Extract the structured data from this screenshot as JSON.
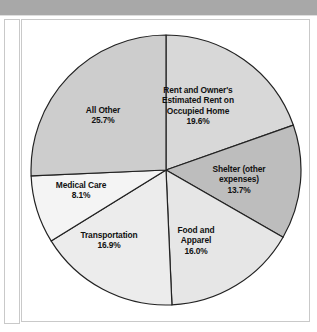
{
  "header": {
    "band_text": "",
    "band_color": "#a8a8a8"
  },
  "figure": {
    "background": "#ffffff",
    "border_color": "#c9c9c9"
  },
  "chart_data": {
    "type": "pie",
    "title": "",
    "subtitle": "",
    "xlabel": "",
    "ylabel": "",
    "legend_position": "none",
    "labels_inline": true,
    "start_angle_deg": 0,
    "direction": "clockwise",
    "categories": [
      "Rent and Owner's Estimated Rent on Occupied Home",
      "Shelter (other expenses)",
      "Food and Apparel",
      "Transportation",
      "Medical Care",
      "All Other"
    ],
    "values": [
      19.6,
      13.7,
      16.0,
      16.9,
      8.1,
      25.7
    ],
    "value_suffix": "%",
    "slices": [
      {
        "name": "Rent and Owner's Estimated Rent on Occupied Home",
        "label_lines": "Rent and Owner's\nEstimated Rent on\nOccupied Home",
        "value": 19.6,
        "value_text": "19.6%",
        "color": "#d8d8d8"
      },
      {
        "name": "Shelter (other expenses)",
        "label_lines": "Shelter (other\nexpenses)",
        "value": 13.7,
        "value_text": "13.7%",
        "color": "#bdbdbd"
      },
      {
        "name": "Food and Apparel",
        "label_lines": "Food and\nApparel",
        "value": 16.0,
        "value_text": "16.0%",
        "color": "#e6e6e6"
      },
      {
        "name": "Transportation",
        "label_lines": "Transportation",
        "value": 16.9,
        "value_text": "16.9%",
        "color": "#ececec"
      },
      {
        "name": "Medical Care",
        "label_lines": "Medical Care",
        "value": 8.1,
        "value_text": "8.1%",
        "color": "#f4f4f4"
      },
      {
        "name": "All Other",
        "label_lines": "All Other",
        "value": 25.7,
        "value_text": "25.7%",
        "color": "#cdcdcd"
      }
    ],
    "stroke_color": "#222222",
    "stroke_width": 1.2
  }
}
